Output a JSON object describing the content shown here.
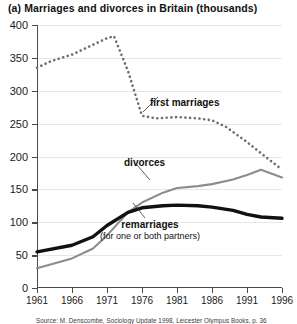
{
  "chart_data": {
    "type": "line",
    "title": "(a) Marriages and divorces in Britain (thousands)",
    "xlabel": "",
    "ylabel": "",
    "xlim": [
      1961,
      1996
    ],
    "ylim": [
      0,
      400
    ],
    "grid": true,
    "legend_position": "inline-annotations",
    "xticks": [
      "1961",
      "1966",
      "1971",
      "1976",
      "1981",
      "1986",
      "1991",
      "1996"
    ],
    "yticks": [
      "0",
      "50",
      "100",
      "150",
      "200",
      "250",
      "300",
      "350",
      "400"
    ],
    "series": [
      {
        "name": "first marriages",
        "style": "dotted",
        "color": "#6e6e6e",
        "x": [
          1961,
          1963,
          1966,
          1969,
          1971,
          1972,
          1974,
          1976,
          1978,
          1981,
          1984,
          1986,
          1988,
          1991,
          1993,
          1996
        ],
        "values": [
          335,
          345,
          355,
          370,
          380,
          383,
          330,
          262,
          258,
          260,
          258,
          255,
          245,
          222,
          205,
          180
        ]
      },
      {
        "name": "divorces",
        "style": "solid",
        "color": "#8c8c8c",
        "x": [
          1961,
          1966,
          1969,
          1971,
          1974,
          1976,
          1979,
          1981,
          1984,
          1986,
          1989,
          1991,
          1993,
          1996
        ],
        "values": [
          30,
          45,
          60,
          80,
          115,
          130,
          145,
          152,
          155,
          158,
          165,
          172,
          180,
          168
        ]
      },
      {
        "name": "remarriages",
        "style": "solid-bold",
        "color": "#111111",
        "x": [
          1961,
          1966,
          1969,
          1971,
          1974,
          1976,
          1979,
          1981,
          1984,
          1986,
          1989,
          1991,
          1993,
          1996
        ],
        "values": [
          55,
          65,
          78,
          95,
          115,
          122,
          125,
          126,
          125,
          123,
          118,
          112,
          108,
          106
        ]
      }
    ],
    "annotations": [
      {
        "key": "first",
        "text": "first marriages"
      },
      {
        "key": "divorces",
        "text": "divorces"
      },
      {
        "key": "remarriages",
        "text": "remarriages"
      },
      {
        "key": "remarriages_sub",
        "text": "(for one or both partners)"
      }
    ]
  },
  "source": {
    "text": "Source: M. Denscombe, Sociology Update 1998, Leicester Olympus Books, p. 36"
  }
}
